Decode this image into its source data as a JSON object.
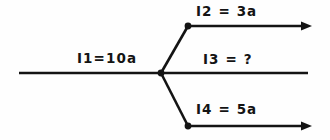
{
  "figure": {
    "type": "current-branching-diagram",
    "background_color": "#fefefe",
    "stroke_color": "#141414",
    "labels": {
      "input": "I1=10a",
      "branch_top": "I2 = 3a",
      "branch_middle": "I3 = ?",
      "branch_bottom": "I4 = 5a"
    },
    "branches": [
      {
        "name": "I2",
        "value": "3a",
        "position": "top",
        "has_arrowhead": true
      },
      {
        "name": "I3",
        "value": "?",
        "position": "middle",
        "has_arrowhead": false
      },
      {
        "name": "I4",
        "value": "5a",
        "position": "bottom",
        "has_arrowhead": true
      }
    ],
    "input_branch": {
      "name": "I1",
      "value": "10a",
      "has_arrowhead": false
    }
  }
}
